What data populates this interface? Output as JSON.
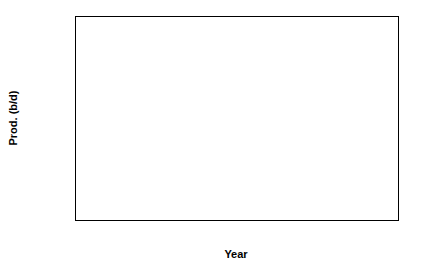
{
  "chart_data": {
    "type": "line",
    "title": "",
    "xlabel": "Year",
    "ylabel": "Prod. (b/d)",
    "xlim": [
      1978,
      2005
    ],
    "ylim": [
      200000,
      500000
    ],
    "grid": false,
    "legend": null,
    "x_ticks": [
      1980,
      1985,
      1990,
      1995,
      2000,
      2005
    ],
    "x_tick_labels": [
      "1980",
      "1985",
      "1990",
      "1995",
      "2000",
      "2005"
    ],
    "x_minor_interval": 1,
    "y_ticks": [
      200000,
      250000,
      300000,
      350000,
      400000,
      450000,
      500000
    ],
    "y_tick_labels": [
      "200000",
      "250000",
      "300000",
      "350000",
      "400000",
      "450000",
      "500000"
    ],
    "y_minor_interval": 12500,
    "marker": "square",
    "marker_color": "#000000",
    "line_color": "#1a1a1a",
    "x": [
      1980,
      1981,
      1982,
      1983,
      1984,
      1985,
      1986,
      1987,
      1988,
      1989,
      1990,
      1991,
      1992,
      1993,
      1994,
      1995,
      1996,
      1997,
      1998,
      1999,
      2000,
      2001,
      2002
    ],
    "values": [
      312000,
      221000,
      236000,
      255000,
      266000,
      292000,
      318000,
      281000,
      284000,
      290000,
      327000,
      347000,
      410000,
      481000,
      460000,
      429000,
      435000,
      448000,
      435000,
      475000,
      485000,
      468000,
      497000
    ],
    "series": [
      {
        "name": "Prod. (b/d)",
        "x": [
          1980,
          1981,
          1982,
          1983,
          1984,
          1985,
          1986,
          1987,
          1988,
          1989,
          1990,
          1991,
          1992,
          1993,
          1994,
          1995,
          1996,
          1997,
          1998,
          1999,
          2000,
          2001,
          2002
        ],
        "values": [
          312000,
          221000,
          236000,
          255000,
          266000,
          292000,
          318000,
          281000,
          284000,
          290000,
          327000,
          347000,
          410000,
          481000,
          460000,
          429000,
          435000,
          448000,
          435000,
          475000,
          485000,
          468000,
          497000
        ]
      }
    ]
  }
}
